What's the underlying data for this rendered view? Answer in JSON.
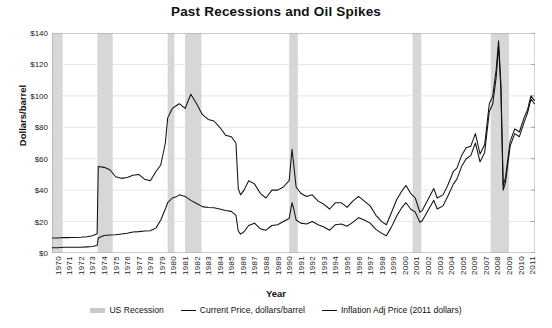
{
  "chart_data": {
    "type": "line",
    "title": "Past Recessions and Oil Spikes",
    "xlabel": "Year",
    "ylabel": "Dollars/barrel",
    "ylim": [
      0,
      140
    ],
    "xlim": [
      1970,
      2011.75
    ],
    "ytick_labels": [
      "$0",
      "$20",
      "$40",
      "$60",
      "$80",
      "$100",
      "$120",
      "$140"
    ],
    "ytick_values": [
      0,
      20,
      40,
      60,
      80,
      100,
      120,
      140
    ],
    "xtick_labels": [
      "1970",
      "1971",
      "1972",
      "1973",
      "1974",
      "1975",
      "1976",
      "1977",
      "1978",
      "1979",
      "1980",
      "1981",
      "1982",
      "1983",
      "1984",
      "1985",
      "1986",
      "1987",
      "1988",
      "1989",
      "1990",
      "1991",
      "1992",
      "1993",
      "1994",
      "1995",
      "1996",
      "1997",
      "1998",
      "1999",
      "2000",
      "2001",
      "2002",
      "2003",
      "2004",
      "2005",
      "2006",
      "2007",
      "2008",
      "2009",
      "2010",
      "2011"
    ],
    "grid": true,
    "legend_position": "bottom",
    "colors": {
      "line": "#111111",
      "recession_band": "#c9c9c9",
      "grid": "#d8d8d8",
      "axis": "#888888"
    },
    "legend": [
      {
        "label": "US Recession",
        "marker": "band"
      },
      {
        "label": "Current Price, dollars/barrel",
        "marker": "line"
      },
      {
        "label": "Inflation Adj Price (2011 dollars)",
        "marker": "line"
      }
    ],
    "recessions": [
      {
        "start": 1969.92,
        "end": 1970.92
      },
      {
        "start": 1973.92,
        "end": 1975.25
      },
      {
        "start": 1980.0,
        "end": 1980.58
      },
      {
        "start": 1981.5,
        "end": 1982.92
      },
      {
        "start": 1990.5,
        "end": 1991.25
      },
      {
        "start": 2001.17,
        "end": 2001.92
      },
      {
        "start": 2007.92,
        "end": 2009.5
      }
    ],
    "series": [
      {
        "name": "Current Price, dollars/barrel",
        "x": [
          1970.0,
          1970.5,
          1971.0,
          1971.5,
          1972.0,
          1972.5,
          1973.0,
          1973.5,
          1973.9,
          1974.0,
          1974.5,
          1975.0,
          1975.5,
          1976.0,
          1976.5,
          1977.0,
          1977.5,
          1978.0,
          1978.5,
          1979.0,
          1979.4,
          1979.8,
          1980.0,
          1980.4,
          1980.8,
          1981.0,
          1981.5,
          1982.0,
          1982.5,
          1983.0,
          1983.5,
          1984.0,
          1984.5,
          1985.0,
          1985.5,
          1985.9,
          1986.1,
          1986.3,
          1986.6,
          1987.0,
          1987.5,
          1988.0,
          1988.5,
          1989.0,
          1989.5,
          1990.0,
          1990.5,
          1990.75,
          1990.9,
          1991.1,
          1991.5,
          1992.0,
          1992.5,
          1993.0,
          1993.5,
          1994.0,
          1994.5,
          1995.0,
          1995.5,
          1996.0,
          1996.5,
          1997.0,
          1997.5,
          1998.0,
          1998.5,
          1998.9,
          1999.3,
          1999.8,
          2000.2,
          2000.6,
          2001.0,
          2001.4,
          2001.8,
          2002.0,
          2002.5,
          2003.0,
          2003.3,
          2003.8,
          2004.2,
          2004.7,
          2005.0,
          2005.4,
          2005.8,
          2006.2,
          2006.6,
          2007.0,
          2007.4,
          2007.8,
          2008.1,
          2008.4,
          2008.6,
          2008.8,
          2009.0,
          2009.2,
          2009.6,
          2010.0,
          2010.4,
          2010.8,
          2011.1,
          2011.4,
          2011.7
        ],
        "y": [
          3.4,
          3.4,
          3.6,
          3.6,
          3.6,
          3.6,
          3.9,
          4.2,
          4.8,
          9.5,
          11.2,
          11.5,
          11.6,
          12.1,
          12.6,
          13.3,
          13.6,
          14.0,
          14.2,
          16.0,
          21.0,
          28.0,
          32.0,
          35.0,
          36.0,
          37.0,
          36.0,
          33.5,
          31.5,
          29.5,
          29.0,
          28.8,
          28.0,
          27.0,
          26.5,
          24.0,
          14.0,
          12.0,
          13.5,
          17.5,
          19.0,
          15.5,
          14.5,
          17.5,
          18.0,
          20.0,
          22.0,
          32.0,
          28.0,
          21.0,
          19.0,
          18.5,
          20.0,
          18.0,
          16.5,
          14.5,
          18.0,
          18.5,
          17.0,
          19.5,
          22.5,
          21.0,
          19.0,
          15.0,
          12.5,
          11.0,
          16.0,
          23.5,
          28.5,
          32.0,
          28.0,
          26.0,
          19.5,
          20.5,
          27.0,
          33.5,
          28.0,
          30.0,
          36.0,
          44.0,
          47.0,
          55.0,
          60.0,
          62.0,
          70.0,
          58.0,
          64.0,
          90.0,
          95.0,
          112.0,
          132.0,
          104.0,
          40.0,
          45.0,
          68.0,
          76.0,
          74.0,
          83.0,
          89.0,
          98.0,
          95.0
        ]
      },
      {
        "name": "Inflation Adj Price (2011 dollars)",
        "x": [
          1970.0,
          1970.5,
          1971.0,
          1971.5,
          1972.0,
          1972.5,
          1973.0,
          1973.5,
          1973.9,
          1974.0,
          1974.5,
          1975.0,
          1975.5,
          1976.0,
          1976.5,
          1977.0,
          1977.5,
          1978.0,
          1978.5,
          1979.0,
          1979.4,
          1979.8,
          1980.0,
          1980.4,
          1980.8,
          1981.0,
          1981.5,
          1982.0,
          1982.5,
          1983.0,
          1983.5,
          1984.0,
          1984.5,
          1985.0,
          1985.5,
          1985.9,
          1986.1,
          1986.3,
          1986.6,
          1987.0,
          1987.5,
          1988.0,
          1988.5,
          1989.0,
          1989.5,
          1990.0,
          1990.5,
          1990.75,
          1990.9,
          1991.1,
          1991.5,
          1992.0,
          1992.5,
          1993.0,
          1993.5,
          1994.0,
          1994.5,
          1995.0,
          1995.5,
          1996.0,
          1996.5,
          1997.0,
          1997.5,
          1998.0,
          1998.5,
          1998.9,
          1999.3,
          1999.8,
          2000.2,
          2000.6,
          2001.0,
          2001.4,
          2001.8,
          2002.0,
          2002.5,
          2003.0,
          2003.3,
          2003.8,
          2004.2,
          2004.7,
          2005.0,
          2005.4,
          2005.8,
          2006.2,
          2006.6,
          2007.0,
          2007.4,
          2007.8,
          2008.1,
          2008.4,
          2008.6,
          2008.8,
          2009.0,
          2009.2,
          2009.6,
          2010.0,
          2010.4,
          2010.8,
          2011.1,
          2011.4,
          2011.7
        ],
        "y": [
          9.5,
          9.5,
          9.8,
          9.8,
          9.9,
          10.0,
          10.3,
          11.0,
          12.2,
          55.0,
          54.5,
          53.0,
          48.5,
          47.5,
          48.0,
          49.5,
          50.0,
          47.0,
          46.0,
          52.0,
          56.0,
          70.0,
          86.0,
          92.0,
          94.0,
          95.0,
          92.0,
          101.0,
          95.0,
          88.0,
          85.0,
          84.0,
          80.0,
          75.0,
          74.0,
          70.0,
          41.0,
          37.0,
          40.0,
          46.0,
          44.0,
          38.0,
          35.0,
          40.0,
          40.0,
          42.0,
          46.0,
          66.0,
          56.0,
          42.0,
          38.0,
          36.0,
          37.0,
          33.0,
          31.0,
          28.0,
          32.0,
          32.0,
          29.0,
          33.0,
          36.0,
          33.0,
          30.0,
          24.0,
          20.0,
          18.0,
          25.0,
          34.0,
          39.0,
          43.0,
          38.0,
          35.0,
          26.0,
          27.0,
          34.0,
          41.0,
          35.0,
          37.0,
          43.0,
          52.0,
          54.0,
          62.0,
          67.0,
          68.0,
          76.0,
          63.0,
          69.0,
          95.0,
          100.0,
          117.0,
          135.0,
          108.0,
          43.0,
          48.0,
          71.0,
          79.0,
          77.0,
          86.0,
          91.0,
          100.0,
          97.0
        ]
      }
    ]
  }
}
